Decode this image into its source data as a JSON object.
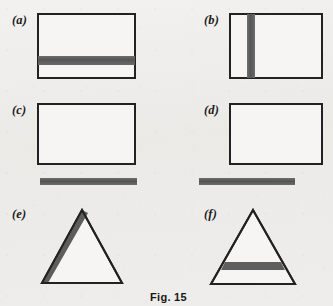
{
  "figure": {
    "caption": "Fig. 15",
    "background_color": "#efeeec",
    "stroke_color": "#222222",
    "band_color": "#5a5a5a"
  },
  "panels": [
    {
      "label": "(a)",
      "shape": "rectangle",
      "marking": "horizontal-band-inside-lower-third",
      "band_orientation": "horizontal"
    },
    {
      "label": "(b)",
      "shape": "rectangle",
      "marking": "vertical-band-inside-left-third",
      "band_orientation": "vertical"
    },
    {
      "label": "(c)",
      "shape": "rectangle",
      "marking": "separate-horizontal-bar-below",
      "band_orientation": "horizontal"
    },
    {
      "label": "(d)",
      "shape": "rectangle",
      "marking": "separate-horizontal-bar-below",
      "band_orientation": "horizontal"
    },
    {
      "label": "(e)",
      "shape": "triangle",
      "marking": "thickened-shaded-left-edge",
      "band_orientation": "edge"
    },
    {
      "label": "(f)",
      "shape": "triangle",
      "marking": "horizontal-band-near-base",
      "band_orientation": "horizontal"
    }
  ]
}
